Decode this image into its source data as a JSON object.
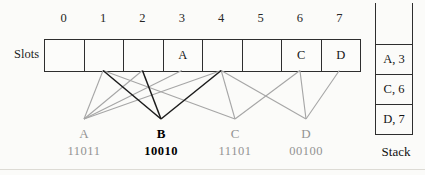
{
  "figure": {
    "slots_label": "Slots",
    "stack_label": "Stack",
    "indices": [
      "0",
      "1",
      "2",
      "3",
      "4",
      "5",
      "6",
      "7"
    ],
    "slot_contents": [
      "",
      "",
      "",
      "A",
      "",
      "",
      "C",
      "D"
    ],
    "keys": [
      {
        "name": "A",
        "binary": "11011",
        "slots": [
          1,
          2,
          3,
          4
        ],
        "emphasis": false
      },
      {
        "name": "B",
        "binary": "10010",
        "slots": [
          1,
          2,
          4
        ],
        "emphasis": true
      },
      {
        "name": "C",
        "binary": "11101",
        "slots": [
          1,
          4,
          6
        ],
        "emphasis": false
      },
      {
        "name": "D",
        "binary": "00100",
        "slots": [
          4,
          6,
          7
        ],
        "emphasis": false
      }
    ],
    "stack_entries": [
      "A, 3",
      "C, 6",
      "D, 7"
    ],
    "colors": {
      "emphasis_line": "#1c1c1c",
      "muted_line": "#a6a6a6",
      "border": "#2e2e2e",
      "background": "#fbfbf9"
    }
  }
}
